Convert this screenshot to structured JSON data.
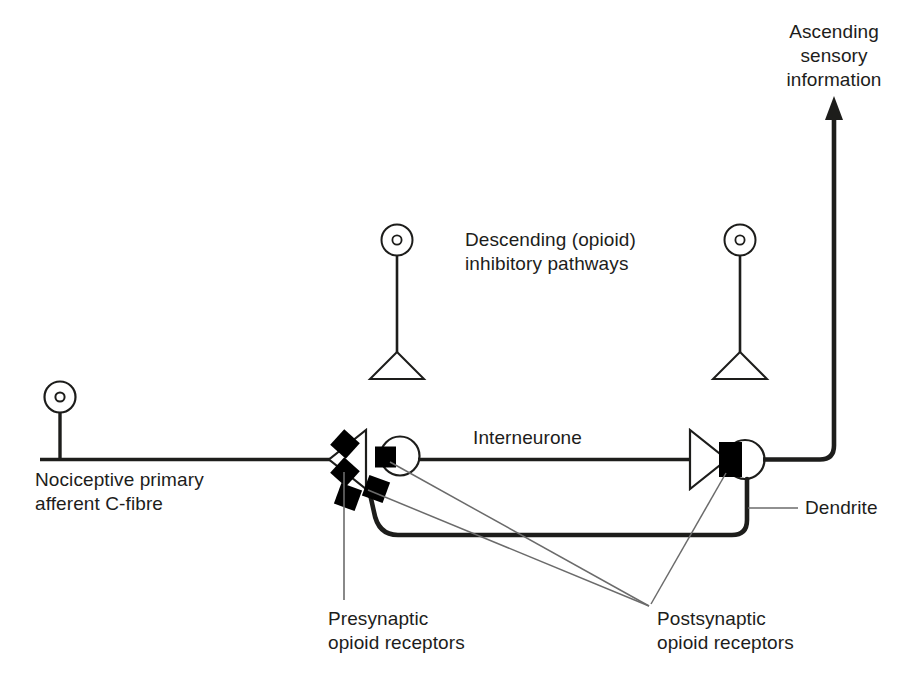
{
  "figure": {
    "kind": "neuroscience-schematic",
    "title_visible": false,
    "background_color": "#ffffff",
    "stroke_color": "#1d1d1b",
    "receptor_fill": "#000000",
    "thin_leader_color": "#6b6b6b"
  },
  "labels": {
    "ascending": "Ascending\nsensory\ninformation",
    "descending": "Descending (opioid)\ninhibitory pathways",
    "interneurone": "Interneurone",
    "nociceptive": "Nociceptive primary\nafferent C-fibre",
    "dendrite": "Dendrite",
    "presynaptic": "Presynaptic\nopioid receptors",
    "postsynaptic": "Postsynaptic\nopioid receptors"
  },
  "elements": {
    "c_fibre_soma": "cell-body-circle-with-nucleus",
    "c_fibre_axon": "horizontal-thick-axon",
    "presynaptic_terminal": "left-pointing-triangle-bouton",
    "presynaptic_receptors_count": 2,
    "interneurone_soma": "circle",
    "interneurone_postsynaptic_receptor": "black-square",
    "interneurone_terminal": "right-pointing-triangle-bouton",
    "projection_neurone_soma": "circle",
    "projection_postsynaptic_receptor": "black-rectangle",
    "dendrite_receptors_count": 2,
    "ascending_axon": "thick-line-with-up-arrow",
    "descending_neurones_count": 2,
    "descending_neurone_soma": "small-circle-with-nucleus",
    "descending_neurone_terminal": "down-pointing-triangle"
  }
}
